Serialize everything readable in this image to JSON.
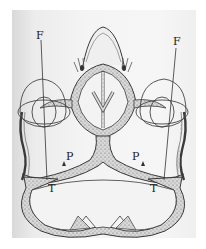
{
  "figure": {
    "type": "anatomical cross-section diagram",
    "labels": {
      "left_F": "F",
      "right_F": "F",
      "left_P": "P",
      "right_P": "P",
      "left_T": "T",
      "right_T": "T"
    },
    "colors": {
      "ink": "#3a3a3a",
      "bone_fill": "#cfcfcf",
      "paper": "#f2f2f2",
      "margin": "#ffffff"
    }
  }
}
